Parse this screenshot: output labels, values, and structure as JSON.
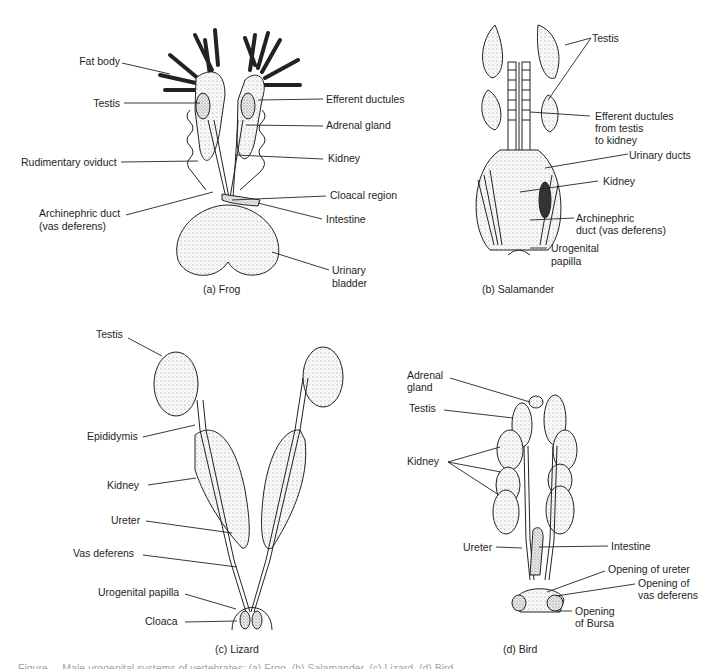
{
  "panels": {
    "frog": {
      "caption": "(a) Frog",
      "labels": {
        "fat_body": "Fat body",
        "testis": "Testis",
        "rudimentary_oviduct": "Rudimentary oviduct",
        "archinephric_duct_1": "Archinephric duct",
        "archinephric_duct_2": "(vas deferens)",
        "efferent_ductules": "Efferent ductules",
        "adrenal_gland": "Adrenal gland",
        "kidney": "Kidney",
        "cloacal_region": "Cloacal region",
        "intestine": "Intestine",
        "urinary_bladder_1": "Urinary",
        "urinary_bladder_2": "bladder"
      }
    },
    "salamander": {
      "caption": "(b) Salamander",
      "labels": {
        "testis": "Testis",
        "efferent_1": "Efferent ductules",
        "efferent_2": "from testis",
        "efferent_3": "to kidney",
        "urinary_ducts": "Urinary ducts",
        "kidney": "Kidney",
        "archinephric_1": "Archinephric",
        "archinephric_2": "duct (vas deferens)",
        "urogenital_1": "Urogenital",
        "urogenital_2": "papilla"
      }
    },
    "lizard": {
      "caption": "(c) Lizard",
      "labels": {
        "testis": "Testis",
        "epididymis": "Epididymis",
        "kidney": "Kidney",
        "ureter": "Ureter",
        "vas_deferens": "Vas deferens",
        "urogenital_papilla": "Urogenital papilla",
        "cloaca": "Cloaca"
      }
    },
    "bird": {
      "caption": "(d) Bird",
      "labels": {
        "adrenal_1": "Adrenal",
        "adrenal_2": "gland",
        "testis": "Testis",
        "kidney": "Kidney",
        "ureter": "Ureter",
        "intestine": "Intestine",
        "opening_ureter": "Opening of ureter",
        "opening_vas_1": "Opening of",
        "opening_vas_2": "vas deferens",
        "opening_bursa_1": "Opening",
        "opening_bursa_2": "of Bursa"
      }
    }
  },
  "figure_caption_partial": "Figure ... Male urogenital systems of vertebrates: (a) Frog, (b) Salamander, (c) Lizard, (d) Bird"
}
